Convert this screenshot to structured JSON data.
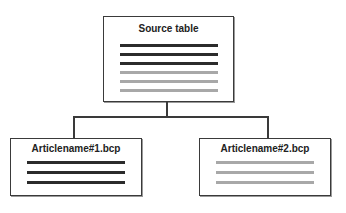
{
  "diagram": {
    "source": {
      "title": "Source table",
      "rows": [
        {
          "shade": "dark",
          "color": "#2b2b2b"
        },
        {
          "shade": "dark",
          "color": "#2b2b2b"
        },
        {
          "shade": "dark",
          "color": "#2b2b2b"
        },
        {
          "shade": "light",
          "color": "#a8a8a8"
        },
        {
          "shade": "light",
          "color": "#a8a8a8"
        },
        {
          "shade": "light",
          "color": "#a8a8a8"
        }
      ]
    },
    "targets": [
      {
        "title": "Articlename#1.bcp",
        "rows": [
          {
            "shade": "dark",
            "color": "#2b2b2b"
          },
          {
            "shade": "dark",
            "color": "#2b2b2b"
          },
          {
            "shade": "dark",
            "color": "#2b2b2b"
          }
        ]
      },
      {
        "title": "Articlename#2.bcp",
        "rows": [
          {
            "shade": "light",
            "color": "#a8a8a8"
          },
          {
            "shade": "light",
            "color": "#a8a8a8"
          },
          {
            "shade": "light",
            "color": "#a8a8a8"
          }
        ]
      }
    ]
  }
}
